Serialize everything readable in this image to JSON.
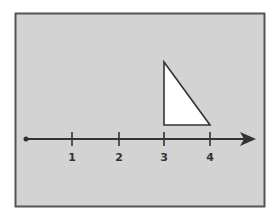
{
  "figure": {
    "background": "#ffffff",
    "panel": {
      "fill": "#d3d3d3",
      "border": "#555555",
      "x": 15,
      "y": 13,
      "width": 249,
      "height": 193
    },
    "number_line": {
      "y": 139,
      "start_x": 26,
      "end_x": 256,
      "color": "#333333",
      "origin_dot": true,
      "ticks": [
        {
          "value": "1",
          "x": 72
        },
        {
          "value": "2",
          "x": 119
        },
        {
          "value": "3",
          "x": 164
        },
        {
          "value": "4",
          "x": 210
        }
      ]
    },
    "triangle": {
      "fill": "#ffffff",
      "stroke": "#333333",
      "points": [
        [
          164,
          62
        ],
        [
          164,
          125
        ],
        [
          210,
          125
        ]
      ]
    }
  }
}
